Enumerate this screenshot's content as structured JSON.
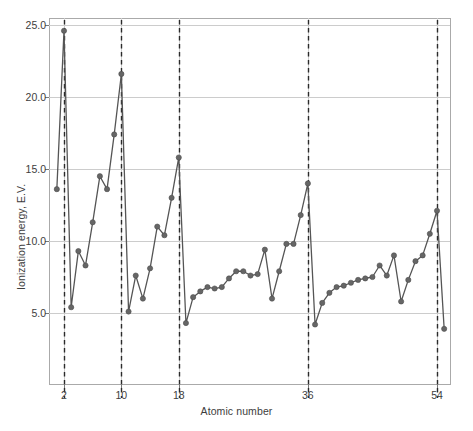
{
  "chart_data": {
    "type": "line",
    "title": "",
    "xlabel": "Atomic number",
    "ylabel": "Ionization energy, E.V.",
    "xlim": [
      0,
      56
    ],
    "ylim": [
      2.5,
      26.5
    ],
    "grid": true,
    "legend": null,
    "y_ticks": [
      "5.0",
      "10.0",
      "15.0",
      "20.0",
      "25.0"
    ],
    "y_tick_values": [
      5.0,
      10.0,
      15.0,
      20.0,
      25.0
    ],
    "x_ticks": [
      "2",
      "10",
      "18",
      "36",
      "54"
    ],
    "x_tick_values": [
      2,
      10,
      18,
      36,
      54
    ],
    "noble_gas_markers": [
      2,
      10,
      18,
      36,
      54
    ],
    "marker_style": "filled-circle",
    "line_color": "#555555",
    "marker_color": "#666666",
    "grid_color": "#cccccc",
    "axis_color": "#aaaaaa",
    "x": [
      1,
      2,
      3,
      4,
      5,
      6,
      7,
      8,
      9,
      10,
      11,
      12,
      13,
      14,
      15,
      16,
      17,
      18,
      19,
      20,
      21,
      22,
      23,
      24,
      25,
      26,
      27,
      28,
      29,
      30,
      31,
      32,
      33,
      34,
      35,
      36,
      37,
      38,
      39,
      40,
      41,
      42,
      43,
      44,
      45,
      46,
      47,
      48,
      49,
      50,
      51,
      52,
      53,
      54,
      55
    ],
    "values": [
      13.6,
      24.6,
      5.4,
      9.3,
      8.3,
      11.3,
      14.5,
      13.6,
      17.4,
      21.6,
      5.1,
      7.6,
      6.0,
      8.1,
      11.0,
      10.4,
      13.0,
      15.8,
      4.3,
      6.1,
      6.5,
      6.8,
      6.7,
      6.8,
      7.4,
      7.9,
      7.9,
      7.6,
      7.7,
      9.4,
      6.0,
      7.9,
      9.8,
      9.8,
      11.8,
      14.0,
      4.2,
      5.7,
      6.4,
      6.8,
      6.9,
      7.1,
      7.3,
      7.4,
      7.5,
      8.3,
      7.6,
      9.0,
      5.8,
      7.3,
      8.6,
      9.0,
      10.5,
      12.1,
      3.9
    ]
  }
}
